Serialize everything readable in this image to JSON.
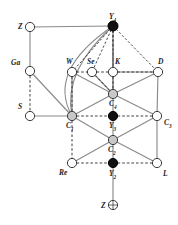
{
  "figure": {
    "width": 178,
    "height": 225,
    "background": "#ffffff"
  },
  "style": {
    "edge_solid_color": "#8a8a8a",
    "edge_dashed_color": "#2b2b2b",
    "node_stroke": "#3a3a3a",
    "fill_open": "#ffffff",
    "fill_gray": "#c8c8c8",
    "fill_black": "#111111",
    "label_color": "#1a1a1a",
    "node_radius": 4.6,
    "top_node_radius": 5.0
  },
  "nodes": [
    {
      "id": "Z_top",
      "label": "Z",
      "sub": "",
      "x": 30,
      "y": 27,
      "fill": "open",
      "label_dx": -12,
      "label_dy": -4
    },
    {
      "id": "Y4",
      "label": "Y",
      "sub": "4",
      "x": 113,
      "y": 26,
      "fill": "black",
      "label_dx": -4,
      "label_dy": -13
    },
    {
      "id": "Ga",
      "label": "Ga",
      "sub": "",
      "x": 30,
      "y": 71,
      "fill": "open",
      "label_dx": -19,
      "label_dy": -12
    },
    {
      "id": "W",
      "label": "W",
      "sub": "",
      "x": 72,
      "y": 72,
      "fill": "open",
      "label_dx": -6,
      "label_dy": -14
    },
    {
      "id": "Se",
      "label": "Se",
      "sub": "",
      "x": 92,
      "y": 72,
      "fill": "open",
      "label_dx": -5,
      "label_dy": -14
    },
    {
      "id": "K",
      "label": "K",
      "sub": "",
      "x": 113,
      "y": 72,
      "fill": "open",
      "label_dx": 2,
      "label_dy": -14
    },
    {
      "id": "D",
      "label": "D",
      "sub": "",
      "x": 158,
      "y": 72,
      "fill": "open",
      "label_dx": 0,
      "label_dy": -14
    },
    {
      "id": "C4",
      "label": "C",
      "sub": "4",
      "x": 113,
      "y": 94,
      "fill": "gray",
      "label_dx": -4,
      "label_dy": 6
    },
    {
      "id": "S",
      "label": "S",
      "sub": "",
      "x": 30,
      "y": 116,
      "fill": "open",
      "label_dx": -12,
      "label_dy": -13
    },
    {
      "id": "C1",
      "label": "C",
      "sub": "1",
      "x": 72,
      "y": 116,
      "fill": "gray",
      "label_dx": -6,
      "label_dy": 6
    },
    {
      "id": "Y3",
      "label": "Y",
      "sub": "3",
      "x": 113,
      "y": 116,
      "fill": "black",
      "label_dx": -4,
      "label_dy": 6
    },
    {
      "id": "C3",
      "label": "C",
      "sub": "3",
      "x": 157,
      "y": 116,
      "fill": "open",
      "label_dx": 7,
      "label_dy": 3
    },
    {
      "id": "C2",
      "label": "C",
      "sub": "2",
      "x": 113,
      "y": 140,
      "fill": "gray",
      "label_dx": -5,
      "label_dy": 6
    },
    {
      "id": "Re",
      "label": "Re",
      "sub": "",
      "x": 72,
      "y": 163,
      "fill": "open",
      "label_dx": -13,
      "label_dy": 6
    },
    {
      "id": "Y2",
      "label": "Y",
      "sub": "2",
      "x": 113,
      "y": 163,
      "fill": "black",
      "label_dx": -4,
      "label_dy": 7
    },
    {
      "id": "L",
      "label": "L",
      "sub": "",
      "x": 157,
      "y": 163,
      "fill": "open",
      "label_dx": 6,
      "label_dy": 7
    },
    {
      "id": "Z_bot",
      "label": "Z",
      "sub": "",
      "x": 113,
      "y": 205,
      "fill": "crosshair",
      "label_dx": -12,
      "label_dy": -3
    }
  ],
  "edges_solid": [
    {
      "from": "Z_top",
      "to": "Y4"
    },
    {
      "from": "Z_top",
      "to": "Ga"
    },
    {
      "from": "Ga",
      "to": "C1"
    },
    {
      "from": "S",
      "to": "C1"
    },
    {
      "from": "W",
      "to": "C1"
    },
    {
      "from": "W",
      "to": "C4"
    },
    {
      "from": "Se",
      "to": "C4"
    },
    {
      "from": "K",
      "to": "C4"
    },
    {
      "from": "K",
      "to": "D"
    },
    {
      "from": "D",
      "to": "C4"
    },
    {
      "from": "D",
      "to": "C3"
    },
    {
      "from": "C4",
      "to": "C1"
    },
    {
      "from": "C4",
      "to": "C3"
    },
    {
      "from": "C1",
      "to": "C2"
    },
    {
      "from": "C3",
      "to": "C2"
    },
    {
      "from": "C2",
      "to": "Re"
    },
    {
      "from": "C2",
      "to": "L"
    },
    {
      "from": "C3",
      "to": "L"
    },
    {
      "from": "Y4",
      "to": "C4"
    },
    {
      "from": "Y3",
      "to": "C2"
    },
    {
      "from": "C4",
      "to": "Y3"
    },
    {
      "from": "C2",
      "to": "Y2"
    },
    {
      "from": "Y2",
      "to": "Z_bot"
    }
  ],
  "edges_dashed": [
    {
      "from": "Ga",
      "to": "S"
    },
    {
      "from": "W",
      "to": "Se"
    },
    {
      "from": "Se",
      "to": "K"
    },
    {
      "from": "K",
      "to": "D"
    },
    {
      "from": "W",
      "to": "C1"
    },
    {
      "from": "C1",
      "to": "Y3"
    },
    {
      "from": "Y3",
      "to": "C3"
    },
    {
      "from": "C1",
      "to": "Re"
    },
    {
      "from": "Re",
      "to": "Y2"
    },
    {
      "from": "Y2",
      "to": "L"
    },
    {
      "from": "Y4",
      "to": "C4"
    },
    {
      "from": "Se",
      "to": "C4"
    }
  ],
  "edges_dashed_fan": [
    {
      "from": "Y4",
      "to": "W"
    },
    {
      "from": "Y4",
      "to": "Se"
    },
    {
      "from": "Y4",
      "to": "K"
    },
    {
      "from": "Y4",
      "to": "D"
    }
  ],
  "edges_curved": [
    {
      "from": "Y4",
      "to": "C1",
      "bow": 1
    },
    {
      "from": "Y4",
      "to": "C1",
      "bow": 2
    }
  ]
}
